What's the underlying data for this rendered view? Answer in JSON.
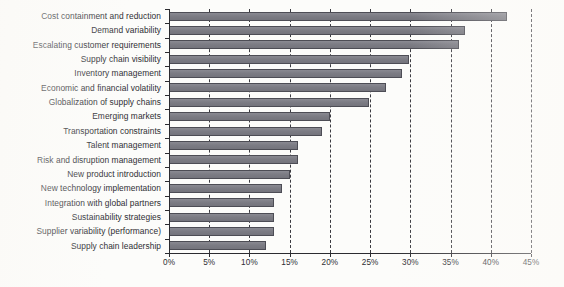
{
  "chart_data": {
    "type": "bar",
    "orientation": "horizontal",
    "title": "",
    "subtitle": "",
    "xlabel": "",
    "ylabel": "",
    "xlim": [
      0,
      45
    ],
    "ylim": null,
    "grid": true,
    "grid_axis": "x",
    "grid_style": "dashed",
    "legend": false,
    "legend_position": "none",
    "bar_color": "#7e7e86",
    "bar_border_color": "#4d4d55",
    "axis_color": "#2b2b30",
    "background_color": "#fcfcfa",
    "value_unit": "%",
    "categories": [
      "Cost containment and reduction",
      "Demand variability",
      "Escalating customer requirements",
      "Supply chain visibility",
      "Inventory management",
      "Economic and financial volatility",
      "Globalization of supply chains",
      "Emerging markets",
      "Transportation constraints",
      "Talent management",
      "Risk and disruption management",
      "New product introduction",
      "New technology implementation",
      "Integration with global partners",
      "Sustainability strategies",
      "Supplier variability (performance)",
      "Supply chain leadership"
    ],
    "values": [
      42,
      36.8,
      36,
      29.8,
      29,
      27,
      24.8,
      20,
      19,
      16,
      16,
      15,
      14,
      13,
      13,
      13,
      12
    ],
    "xticks": [
      0,
      5,
      10,
      15,
      20,
      25,
      30,
      35,
      40,
      45
    ],
    "xticklabels": [
      "0%",
      "5%",
      "10%",
      "15%",
      "20%",
      "25%",
      "30%",
      "35%",
      "40%",
      "45%"
    ]
  }
}
